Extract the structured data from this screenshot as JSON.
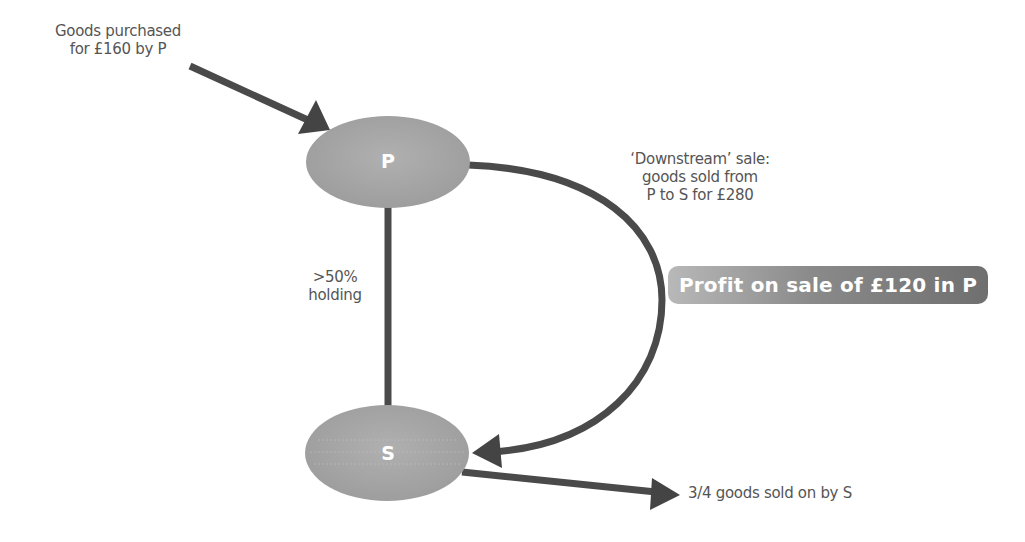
{
  "diagram": {
    "nodes": {
      "parent": {
        "label": "P"
      },
      "subsidiary": {
        "label": "S"
      }
    },
    "annotations": {
      "purchase_line1": "Goods purchased",
      "purchase_line2": "for £160 by P",
      "downstream_line1": "‘Downstream’ sale:",
      "downstream_line2": "goods sold from",
      "downstream_line3": "P to S for £280",
      "holding_line1": ">50%",
      "holding_line2": "holding",
      "sold_on": "3/4 goods sold on by S"
    },
    "callout": {
      "profit": "Profit on sale of £120 in P"
    },
    "colors": {
      "node_fill": "#a9a9a9",
      "arrow": "#444444",
      "text": "#555555",
      "callout_start": "#b8b8b8",
      "callout_end": "#6f6f6f"
    }
  }
}
